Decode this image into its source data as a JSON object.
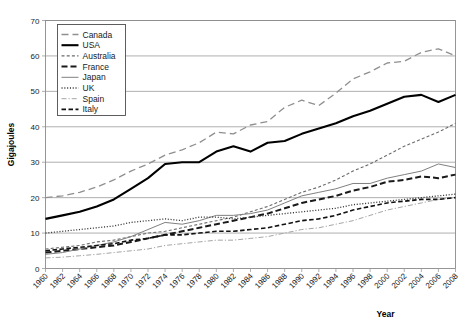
{
  "chart_data": {
    "type": "line",
    "title": "",
    "xlabel": "Year",
    "ylabel": "Gigajoules",
    "xlim": [
      1960,
      2008
    ],
    "ylim": [
      0,
      70
    ],
    "ytick_step": 10,
    "xtick_step": 2,
    "grid": "horizontal",
    "legend_position": "top-left inside plot",
    "yticks": [
      "0",
      "10",
      "20",
      "30",
      "40",
      "50",
      "60",
      "70"
    ],
    "xticks": [
      "1960",
      "1962",
      "1964",
      "1966",
      "1968",
      "1970",
      "1972",
      "1974",
      "1976",
      "1978",
      "1980",
      "1982",
      "1984",
      "1986",
      "1988",
      "1990",
      "1992",
      "1994",
      "1996",
      "1998",
      "2000",
      "2002",
      "2004",
      "2006",
      "2008"
    ],
    "x": [
      1960,
      1962,
      1964,
      1966,
      1968,
      1970,
      1972,
      1974,
      1976,
      1978,
      1980,
      1982,
      1984,
      1986,
      1988,
      1990,
      1992,
      1994,
      1996,
      1998,
      2000,
      2002,
      2004,
      2006,
      2008
    ],
    "series": [
      {
        "name": "Canada",
        "style": "long-dash",
        "color": "#8f8f8f",
        "width": 1.3,
        "dash": "7,4",
        "values": [
          20.0,
          20.5,
          21.5,
          23.0,
          25.0,
          27.5,
          29.5,
          32.0,
          33.5,
          35.5,
          38.5,
          38.0,
          40.5,
          41.5,
          45.5,
          47.5,
          46.0,
          49.5,
          53.5,
          55.5,
          58.0,
          58.5,
          61.0,
          62.0,
          60.0
        ]
      },
      {
        "name": "USA",
        "style": "solid-thick",
        "color": "#000000",
        "width": 2.1,
        "dash": "",
        "values": [
          14.0,
          15.0,
          16.0,
          17.5,
          19.5,
          22.5,
          25.5,
          29.5,
          30.0,
          30.0,
          33.0,
          34.5,
          33.0,
          35.5,
          36.0,
          38.0,
          39.5,
          41.0,
          43.0,
          44.5,
          46.5,
          48.5,
          49.0,
          47.0,
          49.0
        ]
      },
      {
        "name": "Australia",
        "style": "small-dash",
        "color": "#6b6b6b",
        "width": 1.1,
        "dash": "3,2.2",
        "values": [
          5.5,
          6.0,
          6.5,
          7.5,
          8.0,
          9.0,
          10.0,
          10.5,
          11.5,
          12.5,
          13.5,
          14.5,
          16.0,
          17.5,
          19.5,
          21.5,
          23.0,
          25.0,
          27.5,
          29.5,
          32.0,
          34.5,
          36.5,
          38.5,
          41.0
        ]
      },
      {
        "name": "France",
        "style": "bold-dash",
        "color": "#1a1a1a",
        "width": 2.0,
        "dash": "6,3",
        "values": [
          4.5,
          5.0,
          5.5,
          6.0,
          6.5,
          7.5,
          8.5,
          9.5,
          10.5,
          11.5,
          12.5,
          13.5,
          14.5,
          15.5,
          17.0,
          18.5,
          19.5,
          20.5,
          22.0,
          23.0,
          24.5,
          25.0,
          26.0,
          25.5,
          26.5
        ]
      },
      {
        "name": "Japan",
        "style": "solid-thin",
        "color": "#808080",
        "width": 1.0,
        "dash": "",
        "values": [
          4.0,
          4.5,
          5.5,
          6.5,
          7.5,
          9.0,
          11.0,
          13.0,
          12.5,
          13.5,
          15.0,
          15.0,
          15.5,
          16.5,
          18.5,
          20.5,
          21.5,
          22.5,
          24.0,
          24.0,
          25.5,
          26.5,
          27.5,
          29.5,
          28.5
        ]
      },
      {
        "name": "UK",
        "style": "fine-dotted",
        "color": "#3a3a3a",
        "width": 1.3,
        "dash": "1.1,1.7",
        "values": [
          10.0,
          10.5,
          11.0,
          11.5,
          12.0,
          13.0,
          13.5,
          14.0,
          13.5,
          14.5,
          14.5,
          14.0,
          14.5,
          15.0,
          15.5,
          16.0,
          16.5,
          17.0,
          18.0,
          18.5,
          19.0,
          19.5,
          20.0,
          20.5,
          21.0
        ]
      },
      {
        "name": "Spain",
        "style": "dash-dot",
        "color": "#a5a5a5",
        "width": 1.0,
        "dash": "5,2,1.2,2",
        "values": [
          3.0,
          3.2,
          3.6,
          4.0,
          4.5,
          5.0,
          5.5,
          6.5,
          7.0,
          7.5,
          8.0,
          8.0,
          8.5,
          9.0,
          10.0,
          11.0,
          11.5,
          12.5,
          13.5,
          15.0,
          16.5,
          17.5,
          18.5,
          19.5,
          20.0
        ]
      },
      {
        "name": "Italy",
        "style": "medium-dash",
        "color": "#111111",
        "width": 1.6,
        "dash": "4.5,2.5",
        "values": [
          5.0,
          5.5,
          6.0,
          6.5,
          7.0,
          8.0,
          8.5,
          9.5,
          9.5,
          10.0,
          10.5,
          10.5,
          11.0,
          11.5,
          12.5,
          13.5,
          14.0,
          15.0,
          16.5,
          17.5,
          18.5,
          19.0,
          19.5,
          19.5,
          20.0
        ]
      }
    ]
  },
  "legend": {
    "items": [
      {
        "label": "Canada"
      },
      {
        "label": "USA"
      },
      {
        "label": "Australia"
      },
      {
        "label": "France"
      },
      {
        "label": "Japan"
      },
      {
        "label": "UK"
      },
      {
        "label": "Spain"
      },
      {
        "label": "Italy"
      }
    ]
  }
}
